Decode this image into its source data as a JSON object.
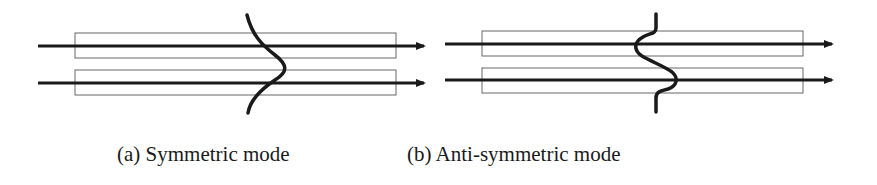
{
  "figure": {
    "panels": [
      {
        "id": "a",
        "caption": "(a) Symmetric mode",
        "mode": "symmetric",
        "waveguides": 2,
        "arrows": 2
      },
      {
        "id": "b",
        "caption": "(b) Anti-symmetric mode",
        "mode": "anti-symmetric",
        "waveguides": 2,
        "arrows": 2
      }
    ],
    "colors": {
      "line": "#1a1a1a",
      "waveguide_border": "#555555",
      "background": "#ffffff"
    }
  }
}
